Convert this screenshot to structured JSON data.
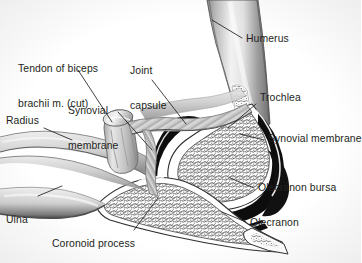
{
  "figure": {
    "background_color": "#ffffff",
    "text_color": "#231f20",
    "bone_fill": "#ffffff",
    "cavity_color": "#0d0d0d",
    "trabecular_color": "#6f6f6f",
    "soft_tissue_color": "#b8b8b8",
    "leader_line_color": "#231f20"
  },
  "labels": {
    "tendon_of_biceps": {
      "line1": "Tendon of biceps",
      "line2": "brachii m. (cut)"
    },
    "joint_capsule": {
      "line1": "Joint",
      "line2": "capsule"
    },
    "synovial_membrane_left": {
      "line1": "Synovial",
      "line2": "membrane"
    },
    "radius": "Radius",
    "ulna": "Ulna",
    "coronoid_process": "Coronoid process",
    "humerus": "Humerus",
    "trochlea": "Trochlea",
    "synovial_membrane_right": "Synovial membrane",
    "olecranon_bursa": "Olecranon bursa",
    "olecranon": "Olecranon"
  }
}
